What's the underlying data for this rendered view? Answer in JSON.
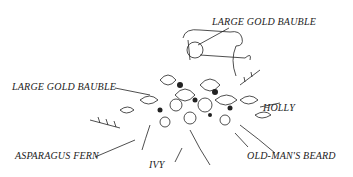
{
  "diagram": {
    "labels": [
      {
        "id": "large-gold-bauble-top",
        "text": "LARGE GOLD BAUBLE"
      },
      {
        "id": "large-gold-bauble-left",
        "text": "LARGE GOLD BAUBLE"
      },
      {
        "id": "holly",
        "text": "HOLLY"
      },
      {
        "id": "asparagus-fern",
        "text": "ASPARAGUS FERN"
      },
      {
        "id": "ivy",
        "text": "IVY"
      },
      {
        "id": "old-mans-beard",
        "text": "OLD-MAN'S BEARD"
      }
    ]
  }
}
